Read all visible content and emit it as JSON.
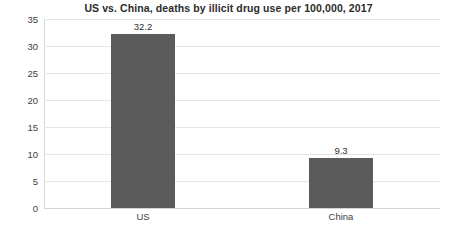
{
  "chart_data": {
    "type": "bar",
    "title": "US vs. China, deaths by illicit drug use per 100,000, 2017",
    "xlabel": "",
    "ylabel": "",
    "categories": [
      "US",
      "China"
    ],
    "values": [
      32.2,
      9.3
    ],
    "value_labels": [
      "32.2",
      "9.3"
    ],
    "ylim": [
      0,
      35
    ],
    "ytick_step": 5,
    "ytick_labels": [
      "0",
      "5",
      "10",
      "15",
      "20",
      "25",
      "30",
      "35"
    ],
    "grid": true,
    "grid_axis": "y",
    "legend": false,
    "legend_position": "none",
    "series": [
      {
        "name": "deaths per 100,000",
        "values": [
          32.2,
          9.3
        ],
        "color": "#5b5b5b"
      }
    ]
  },
  "style": {
    "bar_color": "#5b5b5b",
    "gridline_color": "#e6e6e6",
    "axis_color": "#d9d9d9",
    "title_color": "#2b2b2b",
    "tick_color": "#404040",
    "background": "#ffffff"
  }
}
